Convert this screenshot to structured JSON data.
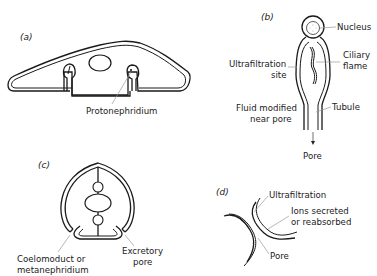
{
  "figure": {
    "panels": [
      {
        "id": "a",
        "label": "(a)",
        "labels": {
          "protonephridium": "Protonephridium"
        }
      },
      {
        "id": "b",
        "label": "(b)",
        "labels": {
          "nucleus": "Nucleus",
          "ciliary_flame_1": "Ciliary",
          "ciliary_flame_2": "flame",
          "ultrafiltration_1": "Ultrafiltration",
          "ultrafiltration_2": "site",
          "fluid_1": "Fluid modified",
          "fluid_2": "near pore",
          "tubule": "Tubule",
          "pore": "Pore"
        }
      },
      {
        "id": "c",
        "label": "(c)",
        "labels": {
          "coelomoduct_1": "Coelomoduct or",
          "coelomoduct_2": "metanephridium",
          "excretory_1": "Excretory",
          "excretory_2": "pore"
        }
      },
      {
        "id": "d",
        "label": "(d)",
        "labels": {
          "ultrafiltration": "Ultrafiltration",
          "ions_1": "Ions secreted",
          "ions_2": "or reabsorbed",
          "pore": "Pore"
        }
      }
    ]
  }
}
